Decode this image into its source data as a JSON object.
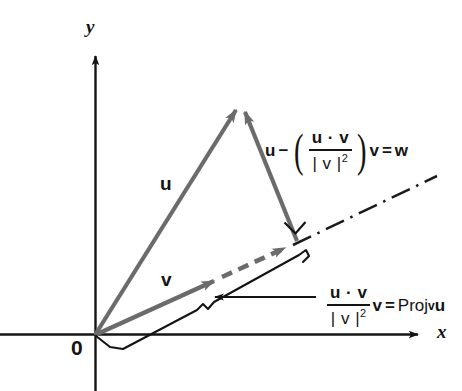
{
  "figure": {
    "title_fragment": "",
    "axes": {
      "x_label": "x",
      "y_label": "y",
      "origin_label": "0"
    },
    "vectors": [
      {
        "name": "u",
        "label": "u",
        "color": "#6b6b6b",
        "from": [
          95,
          335
        ],
        "to": [
          240,
          103
        ]
      },
      {
        "name": "v",
        "label": "v",
        "color": "#6b6b6b",
        "from": [
          95,
          335
        ],
        "to": [
          222,
          277
        ]
      },
      {
        "name": "w",
        "label": "w",
        "color": "#6b6b6b",
        "from": [
          297,
          240
        ],
        "to": [
          240,
          103
        ]
      },
      {
        "name": "projection",
        "label": "",
        "color": "#6b6b6b",
        "from": [
          222,
          277
        ],
        "to": [
          293,
          245
        ]
      }
    ],
    "formulas": {
      "w_formula": {
        "lead": "u",
        "minus": "−",
        "numerator": "u · v",
        "denominator": "| v |",
        "denominator_exponent": "2",
        "trailing_vector": "v",
        "equals": "=",
        "result": "w",
        "plain": "u − ( u·v / |v|² ) v = w"
      },
      "proj_formula": {
        "numerator": "u · v",
        "denominator": "| v |",
        "denominator_exponent": "2",
        "trailing_vector": "v",
        "equals": "=",
        "result_prefix": "Proj",
        "result_subscript": "v",
        "result_operand": "u",
        "plain": "( u·v / |v|² ) v = Proj_v u"
      }
    },
    "annotations": {
      "right_angle_marker": "right-angle",
      "dash_dot_line": "v-direction-extension",
      "brace": "projection-length-brace",
      "leader_arrow": "proj-leader-arrow"
    },
    "colors": {
      "vector": "#6b6b6b",
      "axis": "#141414",
      "text": "#141414",
      "background": "#ffffff"
    }
  }
}
